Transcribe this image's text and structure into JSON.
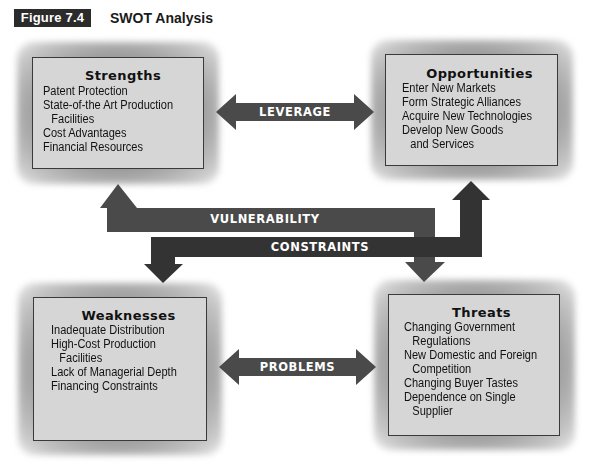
{
  "figure": {
    "label": "Figure 7.4",
    "title": "SWOT Analysis"
  },
  "quadrants": {
    "strengths": {
      "title": "Strengths",
      "items": [
        [
          "Patent Protection"
        ],
        [
          "State-of-the Art Production",
          "Facilities"
        ],
        [
          "Cost Advantages"
        ],
        [
          "Financial Resources"
        ]
      ]
    },
    "opportunities": {
      "title": "Opportunities",
      "items": [
        [
          "Enter New Markets"
        ],
        [
          "Form Strategic Alliances"
        ],
        [
          "Acquire New Technologies"
        ],
        [
          "Develop New Goods",
          "and Services"
        ]
      ]
    },
    "weaknesses": {
      "title": "Weaknesses",
      "items": [
        [
          "Inadequate Distribution"
        ],
        [
          "High-Cost Production",
          "Facilities"
        ],
        [
          "Lack of Managerial Depth"
        ],
        [
          "Financing Constraints"
        ]
      ]
    },
    "threats": {
      "title": "Threats",
      "items": [
        [
          "Changing Government",
          "Regulations"
        ],
        [
          "New Domestic and Foreign",
          "Competition"
        ],
        [
          "Changing Buyer Tastes"
        ],
        [
          "Dependence on Single",
          "Supplier"
        ]
      ]
    }
  },
  "arrows": {
    "leverage": "LEVERAGE",
    "problems": "PROBLEMS",
    "vulnerability": "VULNERABILITY",
    "constraints": "CONSTRAINTS"
  },
  "colors": {
    "box_fill": "#d6d6d6",
    "arrow_dark": "#3a3a3a",
    "arrow_mid": "#4a4a4a",
    "label_bg": "#2b2b2b"
  }
}
